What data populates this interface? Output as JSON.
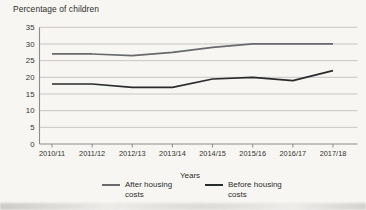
{
  "chart_data": {
    "type": "line",
    "title": "Percentage of children",
    "xlabel": "Years",
    "ylabel": "",
    "categories": [
      "2010/11",
      "2011/12",
      "2012/13",
      "2013/14",
      "2014/15",
      "2015/16",
      "2016/17",
      "2017/18"
    ],
    "series": [
      {
        "name": "After housing costs",
        "color": "#68696c",
        "values": [
          27,
          27,
          26.5,
          27.5,
          29,
          30,
          30,
          30
        ]
      },
      {
        "name": "Before housing costs",
        "color": "#2a2b2d",
        "values": [
          18,
          18,
          17,
          17,
          19.5,
          20,
          19,
          22
        ]
      }
    ],
    "ylim": [
      0,
      35
    ],
    "yticks": [
      0,
      5,
      10,
      15,
      20,
      25,
      30,
      35
    ],
    "grid": true,
    "legend_position": "bottom",
    "colors": {
      "background": "#f7f6f3",
      "gridline": "#bcbab6",
      "axis": "#8e8c88",
      "text": "#34322f"
    }
  }
}
